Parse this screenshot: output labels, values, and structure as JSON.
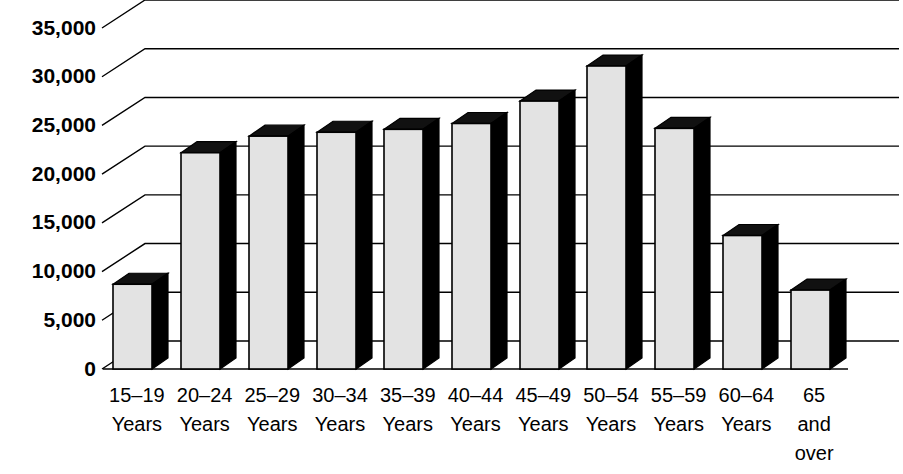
{
  "chart_data": {
    "type": "bar",
    "title": "",
    "xlabel": "",
    "ylabel": "",
    "ylim": [
      0,
      35000
    ],
    "ytick_step": 5000,
    "grid": true,
    "legend": "none",
    "style": "3d-block-bars",
    "categories": [
      "15–19 Years",
      "20–24 Years",
      "25–29 Years",
      "30–34 Years",
      "35–39 Years",
      "40–44 Years",
      "45–49 Years",
      "50–54 Years",
      "55–59 Years",
      "60–64 Years",
      "65 and over"
    ],
    "category_lines": [
      [
        "15–19",
        "Years"
      ],
      [
        "20–24",
        "Years"
      ],
      [
        "25–29",
        "Years"
      ],
      [
        "30–34",
        "Years"
      ],
      [
        "35–39",
        "Years"
      ],
      [
        "40–44",
        "Years"
      ],
      [
        "45–49",
        "Years"
      ],
      [
        "50–54",
        "Years"
      ],
      [
        "55–59",
        "Years"
      ],
      [
        "60–64",
        "Years"
      ],
      [
        "65",
        "and",
        "over"
      ]
    ],
    "values": [
      8700,
      22200,
      23900,
      24300,
      24600,
      25200,
      27500,
      31100,
      24700,
      13700,
      8100
    ],
    "ytick_labels": [
      "0",
      "5,000",
      "10,000",
      "15,000",
      "20,000",
      "25,000",
      "30,000",
      "35,000"
    ],
    "ytick_values": [
      0,
      5000,
      10000,
      15000,
      20000,
      25000,
      30000,
      35000
    ],
    "colors": {
      "bar_face": "#e3e3e3",
      "bar_shadow": "#000000",
      "gridline": "#000000",
      "background": "#ffffff",
      "text": "#000000"
    }
  }
}
